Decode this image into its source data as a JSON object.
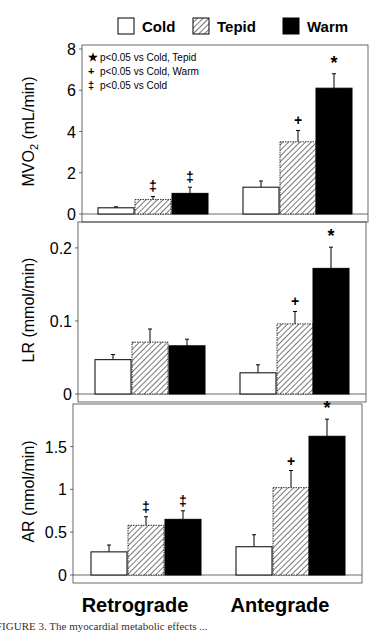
{
  "legend": {
    "items": [
      {
        "label": "Cold",
        "fill": "white"
      },
      {
        "label": "Tepid",
        "fill": "hatched"
      },
      {
        "label": "Warm",
        "fill": "black"
      }
    ]
  },
  "significance_key": [
    {
      "symbol": "*",
      "text": "p<0.05 vs Cold, Tepid"
    },
    {
      "symbol": "+",
      "text": "p<0.05 vs Cold, Warm"
    },
    {
      "symbol": "‡",
      "text": "p<0.05 vs Cold"
    }
  ],
  "caption_fragment": "FIGURE 3. The myocardial metabolic effects ...",
  "chart_data": [
    {
      "type": "bar",
      "title": "",
      "ylabel": "MVO2 (mL/min)",
      "categories": [
        "Retrograde",
        "Antegrade"
      ],
      "yticks": [
        0,
        2,
        4,
        6,
        8
      ],
      "ylim": [
        0,
        8
      ],
      "grid": false,
      "legend_position": "top",
      "series": [
        {
          "name": "Cold",
          "values": [
            0.3,
            1.3
          ],
          "errors": [
            0.05,
            0.3
          ],
          "marks": [
            "",
            ""
          ]
        },
        {
          "name": "Tepid",
          "values": [
            0.7,
            3.5
          ],
          "errors": [
            0.15,
            0.55
          ],
          "marks": [
            "‡",
            "+"
          ]
        },
        {
          "name": "Warm",
          "values": [
            1.0,
            6.1
          ],
          "errors": [
            0.3,
            0.7
          ],
          "marks": [
            "‡",
            "*"
          ]
        }
      ]
    },
    {
      "type": "bar",
      "title": "",
      "ylabel": "LR (mmol/min)",
      "categories": [
        "Retrograde",
        "Antegrade"
      ],
      "yticks": [
        0,
        0.1,
        0.2
      ],
      "ylim": [
        0,
        0.23
      ],
      "grid": false,
      "series": [
        {
          "name": "Cold",
          "values": [
            0.047,
            0.029
          ],
          "errors": [
            0.007,
            0.011
          ],
          "marks": [
            "",
            ""
          ]
        },
        {
          "name": "Tepid",
          "values": [
            0.071,
            0.096
          ],
          "errors": [
            0.018,
            0.017
          ],
          "marks": [
            "",
            "+"
          ]
        },
        {
          "name": "Warm",
          "values": [
            0.066,
            0.172
          ],
          "errors": [
            0.009,
            0.029
          ],
          "marks": [
            "",
            "*"
          ]
        }
      ]
    },
    {
      "type": "bar",
      "title": "",
      "ylabel": "AR (nmol/min)",
      "xlabel": "",
      "categories": [
        "Retrograde",
        "Antegrade"
      ],
      "yticks": [
        0,
        0.5,
        1,
        1.5
      ],
      "ytick_labels": [
        "0",
        "0.5",
        "1",
        "1.5"
      ],
      "ylim": [
        0,
        1.95
      ],
      "grid": false,
      "series": [
        {
          "name": "Cold",
          "values": [
            0.27,
            0.33
          ],
          "errors": [
            0.08,
            0.14
          ],
          "marks": [
            "",
            ""
          ]
        },
        {
          "name": "Tepid",
          "values": [
            0.58,
            1.02
          ],
          "errors": [
            0.1,
            0.2
          ],
          "marks": [
            "‡",
            "+"
          ]
        },
        {
          "name": "Warm",
          "values": [
            0.65,
            1.62
          ],
          "errors": [
            0.1,
            0.2
          ],
          "marks": [
            "‡",
            "*"
          ]
        }
      ]
    }
  ]
}
